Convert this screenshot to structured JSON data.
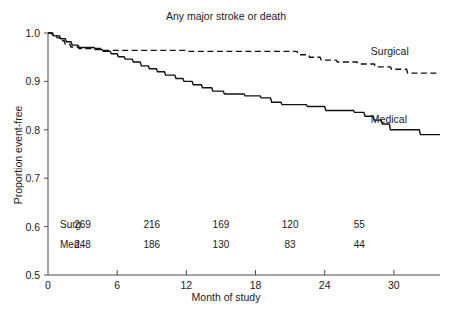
{
  "chart_data": {
    "type": "line",
    "title": "Any major stroke or death",
    "xlabel": "Month of study",
    "ylabel": "Proportion event-free",
    "xlim": [
      0,
      34
    ],
    "ylim": [
      0.5,
      1.0
    ],
    "grid": false,
    "legend_position": "inline-right",
    "xticks": [
      0,
      6,
      12,
      18,
      24,
      30
    ],
    "xtick_labels": [
      "0",
      "6",
      "12",
      "18",
      "24",
      "30"
    ],
    "yticks": [
      0.5,
      0.6,
      0.7,
      0.8,
      0.9,
      1.0
    ],
    "ytick_labels": [
      "0.5",
      "0.6",
      "0.7",
      "0.8",
      "0.9",
      "1.0"
    ],
    "series": [
      {
        "name": "Surgical",
        "style": "dashed",
        "label": "Surgical",
        "label_x": 28.0,
        "label_y": 0.962,
        "points": [
          [
            0.0,
            1.0
          ],
          [
            0.3,
            1.0
          ],
          [
            0.4,
            0.996
          ],
          [
            0.7,
            0.996
          ],
          [
            0.8,
            0.99
          ],
          [
            1.0,
            0.99
          ],
          [
            1.1,
            0.984
          ],
          [
            1.4,
            0.984
          ],
          [
            1.5,
            0.977
          ],
          [
            1.9,
            0.977
          ],
          [
            2.0,
            0.971
          ],
          [
            2.6,
            0.971
          ],
          [
            2.7,
            0.968
          ],
          [
            4.6,
            0.968
          ],
          [
            4.7,
            0.964
          ],
          [
            12.0,
            0.964
          ],
          [
            12.1,
            0.962
          ],
          [
            21.6,
            0.962
          ],
          [
            21.7,
            0.955
          ],
          [
            22.6,
            0.955
          ],
          [
            22.7,
            0.95
          ],
          [
            23.6,
            0.95
          ],
          [
            23.7,
            0.944
          ],
          [
            25.0,
            0.944
          ],
          [
            25.1,
            0.94
          ],
          [
            26.8,
            0.94
          ],
          [
            26.9,
            0.936
          ],
          [
            28.3,
            0.936
          ],
          [
            28.4,
            0.93
          ],
          [
            29.7,
            0.93
          ],
          [
            29.8,
            0.925
          ],
          [
            31.1,
            0.925
          ],
          [
            31.2,
            0.917
          ],
          [
            34.0,
            0.917
          ]
        ]
      },
      {
        "name": "Medical",
        "style": "solid",
        "label": "Medical",
        "label_x": 28.0,
        "label_y": 0.822,
        "points": [
          [
            0.0,
            1.0
          ],
          [
            0.4,
            1.0
          ],
          [
            0.5,
            0.994
          ],
          [
            1.0,
            0.994
          ],
          [
            1.1,
            0.988
          ],
          [
            1.5,
            0.988
          ],
          [
            1.6,
            0.982
          ],
          [
            2.0,
            0.982
          ],
          [
            2.1,
            0.975
          ],
          [
            2.6,
            0.975
          ],
          [
            2.7,
            0.97
          ],
          [
            4.0,
            0.97
          ],
          [
            4.1,
            0.966
          ],
          [
            4.7,
            0.966
          ],
          [
            4.8,
            0.962
          ],
          [
            5.4,
            0.962
          ],
          [
            5.5,
            0.957
          ],
          [
            6.0,
            0.957
          ],
          [
            6.1,
            0.951
          ],
          [
            6.6,
            0.951
          ],
          [
            6.7,
            0.946
          ],
          [
            7.3,
            0.946
          ],
          [
            7.4,
            0.94
          ],
          [
            8.0,
            0.94
          ],
          [
            8.1,
            0.932
          ],
          [
            8.7,
            0.932
          ],
          [
            8.8,
            0.926
          ],
          [
            9.4,
            0.926
          ],
          [
            9.5,
            0.92
          ],
          [
            10.1,
            0.92
          ],
          [
            10.2,
            0.913
          ],
          [
            11.0,
            0.913
          ],
          [
            11.1,
            0.906
          ],
          [
            11.7,
            0.906
          ],
          [
            11.8,
            0.9
          ],
          [
            12.5,
            0.9
          ],
          [
            12.6,
            0.893
          ],
          [
            13.3,
            0.893
          ],
          [
            13.4,
            0.887
          ],
          [
            14.2,
            0.887
          ],
          [
            14.3,
            0.88
          ],
          [
            15.2,
            0.88
          ],
          [
            15.3,
            0.874
          ],
          [
            17.0,
            0.874
          ],
          [
            17.1,
            0.87
          ],
          [
            18.4,
            0.87
          ],
          [
            18.5,
            0.866
          ],
          [
            19.3,
            0.866
          ],
          [
            19.4,
            0.857
          ],
          [
            20.2,
            0.857
          ],
          [
            20.3,
            0.852
          ],
          [
            22.4,
            0.852
          ],
          [
            22.5,
            0.848
          ],
          [
            24.0,
            0.848
          ],
          [
            24.1,
            0.84
          ],
          [
            26.5,
            0.84
          ],
          [
            26.6,
            0.836
          ],
          [
            27.4,
            0.836
          ],
          [
            27.5,
            0.828
          ],
          [
            28.2,
            0.828
          ],
          [
            28.3,
            0.82
          ],
          [
            28.9,
            0.82
          ],
          [
            29.0,
            0.812
          ],
          [
            29.6,
            0.812
          ],
          [
            29.7,
            0.8
          ],
          [
            32.2,
            0.8
          ],
          [
            32.3,
            0.79
          ],
          [
            34.0,
            0.79
          ]
        ]
      }
    ],
    "risk_table": {
      "x_positions": [
        3.0,
        9.0,
        15.0,
        21.0,
        27.0
      ],
      "rows": [
        {
          "label": "Surg.",
          "values": [
            "269",
            "216",
            "169",
            "120",
            "55"
          ]
        },
        {
          "label": "Med.",
          "values": [
            "248",
            "186",
            "130",
            "83",
            "44"
          ]
        }
      ]
    }
  },
  "colors": {
    "curve": "#111111",
    "axis": "#4a4a4a",
    "text": "#1a1a1a",
    "background": "#ffffff"
  }
}
